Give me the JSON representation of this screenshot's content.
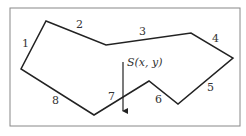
{
  "diagram": {
    "frame": {
      "x": 10,
      "y": 8,
      "width": 230,
      "height": 118,
      "stroke": "#888888"
    },
    "polygon": {
      "stroke": "#222222",
      "vertices": [
        [
          46,
          21
        ],
        [
          106,
          45
        ],
        [
          191,
          33
        ],
        [
          233,
          58
        ],
        [
          178,
          104
        ],
        [
          149,
          81
        ],
        [
          94,
          115
        ],
        [
          21,
          69
        ]
      ]
    },
    "edge_labels": [
      {
        "text": "1",
        "x": 22,
        "y": 47
      },
      {
        "text": "2",
        "x": 76,
        "y": 28
      },
      {
        "text": "3",
        "x": 139,
        "y": 35
      },
      {
        "text": "4",
        "x": 212,
        "y": 42
      },
      {
        "text": "5",
        "x": 207,
        "y": 91
      },
      {
        "text": "6",
        "x": 155,
        "y": 103
      },
      {
        "text": "7",
        "x": 108,
        "y": 100
      },
      {
        "text": "8",
        "x": 52,
        "y": 104
      }
    ],
    "source_point": {
      "label": "S(x, y)",
      "label_x": 127,
      "label_y": 66,
      "arrow": {
        "x": 123,
        "y1": 62,
        "y2": 116
      }
    }
  }
}
